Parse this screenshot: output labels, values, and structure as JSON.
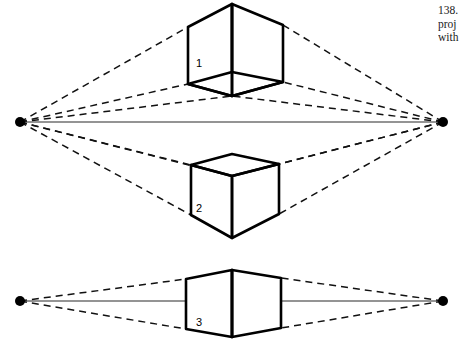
{
  "figure": {
    "caption_lines": [
      "138.",
      "proj",
      "with"
    ],
    "background_color": "#ffffff",
    "line_color": "#000000",
    "horizon_color": "#2b2b2b"
  },
  "diagram": {
    "horizon_upper": {
      "y": 122,
      "x_start": 20,
      "x_end": 443
    },
    "horizon_lower": {
      "y": 301,
      "x_start": 20,
      "x_end": 443
    },
    "vanishing_points": [
      {
        "name": "left-upper",
        "x": 20,
        "y": 122,
        "radius": 5
      },
      {
        "name": "right-upper",
        "x": 443,
        "y": 122,
        "radius": 5
      },
      {
        "name": "left-lower",
        "x": 20,
        "y": 301,
        "radius": 5
      },
      {
        "name": "right-lower",
        "x": 443,
        "y": 301,
        "radius": 5
      }
    ],
    "cubes": [
      {
        "label": "1",
        "position": "above-horizon",
        "visible_face": "bottom",
        "label_x": 196,
        "label_y": 67,
        "front_vertical_top_x": 232,
        "front_vertical_top_y": 4,
        "front_vertical_bottom_x": 232,
        "front_vertical_bottom_y": 72,
        "left_x": 188,
        "left_top_y": 27,
        "left_bottom_y": 84,
        "right_x": 283,
        "right_top_y": 25,
        "right_bottom_y": 82,
        "base_front_x": 232,
        "base_front_y": 96
      },
      {
        "label": "2",
        "position": "below-horizon",
        "visible_face": "top",
        "label_x": 196,
        "label_y": 212,
        "top_back_x": 232,
        "top_back_y": 154,
        "left_x": 191,
        "left_top_y": 165,
        "left_bottom_y": 215,
        "right_x": 279,
        "right_top_y": 164,
        "right_bottom_y": 214,
        "front_top_x": 232,
        "front_top_y": 176,
        "front_bottom_x": 232,
        "front_bottom_y": 238
      },
      {
        "label": "3",
        "position": "on-horizon",
        "visible_face": "none",
        "label_x": 196,
        "label_y": 326,
        "center_x": 232,
        "top_y": 270,
        "bottom_y": 337,
        "left_x": 186,
        "left_top_y": 279,
        "left_bottom_y": 329,
        "right_x": 281,
        "right_top_y": 278,
        "right_bottom_y": 328
      }
    ],
    "rays": {
      "style": "dashed",
      "description": "construction lines converging on the vanishing points"
    }
  }
}
